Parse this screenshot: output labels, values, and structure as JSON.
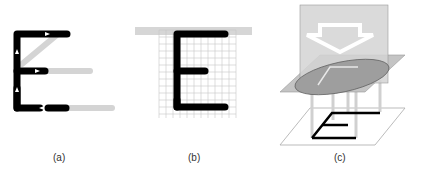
{
  "figure": {
    "panels": [
      {
        "id": "a",
        "label": "(a)",
        "description": "Letter E drawn as strokes with direction arrows"
      },
      {
        "id": "b",
        "label": "(b)",
        "description": "Letter E rasterized on a pixel grid"
      },
      {
        "id": "c",
        "label": "(c)",
        "description": "3D projection of stroke E onto a plane"
      }
    ]
  },
  "colors": {
    "stroke": "#000000",
    "arrow_trail": "#d0d0d0",
    "grid_line": "#c8c8c8",
    "plane_fill": "#bdbdbd",
    "ellipse_fill": "#9a9a9a",
    "vertical_plane": "#cfcfcf"
  }
}
